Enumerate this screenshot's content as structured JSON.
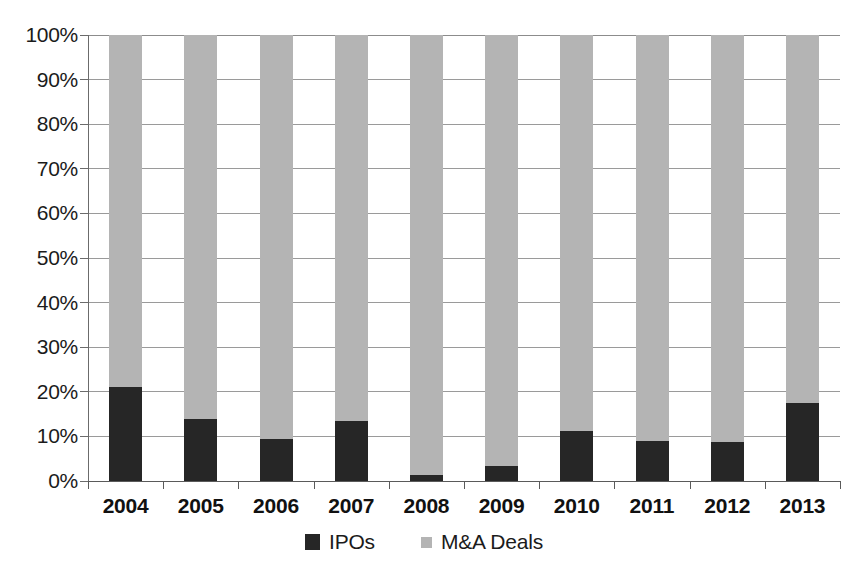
{
  "chart_data": {
    "type": "bar",
    "subtype": "100% stacked bar",
    "title": "",
    "subtitle": "",
    "xlabel": "",
    "ylabel": "",
    "categories": [
      "2004",
      "2005",
      "2006",
      "2007",
      "2008",
      "2009",
      "2010",
      "2011",
      "2012",
      "2013"
    ],
    "series": [
      {
        "name": "IPOs",
        "color": "#262626",
        "values": [
          21.0,
          14.0,
          9.5,
          13.5,
          1.3,
          3.4,
          11.2,
          9.0,
          8.7,
          17.5
        ]
      },
      {
        "name": "M&A Deals",
        "color": "#b4b4b4",
        "values": [
          79.0,
          86.0,
          90.5,
          86.5,
          98.7,
          96.6,
          88.8,
          91.0,
          91.3,
          82.5
        ]
      }
    ],
    "ylim": [
      0,
      100
    ],
    "ytick_values": [
      0,
      10,
      20,
      30,
      40,
      50,
      60,
      70,
      80,
      90,
      100
    ],
    "ytick_labels": [
      "0%",
      "10%",
      "20%",
      "30%",
      "40%",
      "50%",
      "60%",
      "70%",
      "80%",
      "90%",
      "100%"
    ],
    "grid": true,
    "grid_axis": "y",
    "legend_position": "bottom",
    "legend_entries": [
      "IPOs",
      "M&A Deals"
    ],
    "annotations": []
  },
  "colors": {
    "ipo": "#262626",
    "ma_deals": "#b4b4b4",
    "gridline": "#9a9a9a",
    "axis": "#5a5a5a",
    "text": "#1b1b1b",
    "background": "#ffffff"
  }
}
